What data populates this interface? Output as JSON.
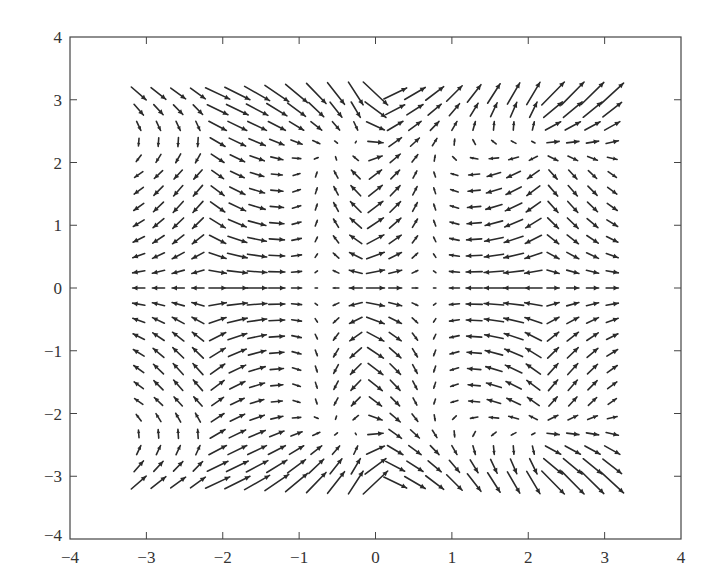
{
  "chart_data": {
    "type": "quiver",
    "title": "",
    "xlabel": "",
    "ylabel": "",
    "xlim": [
      -4,
      4
    ],
    "ylim": [
      -4,
      4
    ],
    "grid": false,
    "legend": null,
    "x_ticks": [
      -4,
      -3,
      -2,
      -1,
      0,
      1,
      2,
      3,
      4
    ],
    "y_ticks": [
      -4,
      -3,
      -2,
      -1,
      0,
      1,
      2,
      3,
      4
    ],
    "x_tick_labels": [
      "−4",
      "−3",
      "−2",
      "−1",
      "0",
      "1",
      "2",
      "3",
      "4"
    ],
    "y_tick_labels": [
      "−4",
      "−3",
      "−2",
      "−1",
      "0",
      "1",
      "2",
      "3",
      "4"
    ],
    "grid_x_range": [
      -3.1,
      3.1
    ],
    "grid_y_range": [
      -3.1,
      3.1
    ],
    "grid_points_per_axis": 25,
    "field_model": {
      "u": "-sin(1.15*x)*cos(0.5*y) - 0.35*x*cos(1.0*y)*0.3 + 0.12*x*y*y*0.25",
      "v": "0.55*cos(1.15*x)*sin(1.0*y) + 0.1*y"
    },
    "arrow_color": "#2a2a2a"
  },
  "axes": {
    "x_tick_labels": [
      "−4",
      "−3",
      "−2",
      "−1",
      "0",
      "1",
      "2",
      "3",
      "4"
    ],
    "y_tick_labels": [
      "4",
      "3",
      "2",
      "1",
      "0",
      "−1",
      "−2",
      "−3",
      "−4"
    ]
  }
}
